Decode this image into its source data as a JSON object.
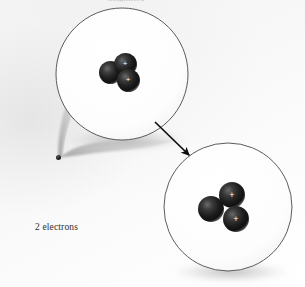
{
  "figure": {
    "width": 305,
    "height": 287,
    "background_color": "#f6f6f6",
    "clipped_header_text": "magnified"
  },
  "labels": {
    "electrons_caption": "2 electrons"
  },
  "colors": {
    "nucleon_fill": "#111111",
    "nucleon_highlight": "#6a6a6a",
    "circle_stroke": "#4a4a4a",
    "arrow": "#0d0d0d",
    "caption_text": "#2e2e2e",
    "shadow": "#9a9a9a",
    "plus_symbol": "#ffffff"
  },
  "atom": {
    "dot_label": "atom",
    "dot_x": 58,
    "dot_y": 157,
    "dot_diameter": 5
  },
  "magnifier_cone": {
    "name": "callout-cone",
    "from_x": 58,
    "from_y": 157,
    "to_circle": "upper-magnified-view"
  },
  "views": [
    {
      "id": "upper-magnified-view",
      "name": "nucleus-view-compact",
      "center_x": 122,
      "center_y": 74,
      "radius": 66,
      "stroke_color": "#4a4a4a",
      "fill_color": "#ffffff",
      "nucleons": [
        {
          "id": "n1",
          "type": "neutron",
          "charge": "",
          "cx": 111,
          "cy": 73,
          "r": 11.5
        },
        {
          "id": "p1",
          "type": "proton",
          "charge": "+",
          "cx": 125,
          "cy": 64,
          "r": 11.5
        },
        {
          "id": "p2",
          "type": "proton",
          "charge": "+",
          "cx": 128,
          "cy": 80,
          "r": 11.5
        }
      ]
    },
    {
      "id": "lower-magnified-view",
      "name": "nucleus-view-expanded",
      "center_x": 228,
      "center_y": 207,
      "radius": 64,
      "stroke_color": "#4a4a4a",
      "fill_color": "#ffffff",
      "nucleons": [
        {
          "id": "n1",
          "type": "neutron",
          "charge": "",
          "cx": 211,
          "cy": 209,
          "r": 13
        },
        {
          "id": "p1",
          "type": "proton",
          "charge": "+",
          "cx": 232,
          "cy": 195,
          "r": 13
        },
        {
          "id": "p2",
          "type": "proton",
          "charge": "+",
          "cx": 236,
          "cy": 219,
          "r": 13
        }
      ]
    }
  ],
  "arrow": {
    "name": "magnify-arrow",
    "x1": 155,
    "y1": 122,
    "x2": 190,
    "y2": 156,
    "color": "#0d0d0d",
    "stroke_width": 1.6
  }
}
